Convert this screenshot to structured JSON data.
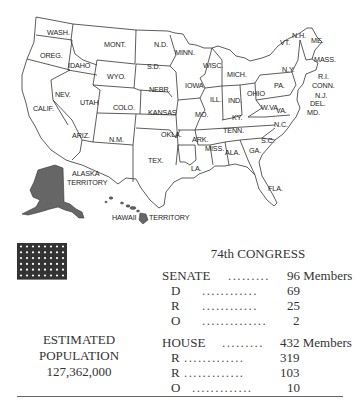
{
  "map": {
    "states": [
      {
        "label": "WASH.",
        "x": 47,
        "y": 35
      },
      {
        "label": "OREG.",
        "x": 40,
        "y": 58
      },
      {
        "label": "IDAHO",
        "x": 68,
        "y": 68
      },
      {
        "label": "MONT.",
        "x": 104,
        "y": 47
      },
      {
        "label": "N.D.",
        "x": 154,
        "y": 47
      },
      {
        "label": "MINN.",
        "x": 175,
        "y": 55
      },
      {
        "label": "S.D.",
        "x": 147,
        "y": 69
      },
      {
        "label": "WYO.",
        "x": 107,
        "y": 79
      },
      {
        "label": "NEBR.",
        "x": 149,
        "y": 92
      },
      {
        "label": "IOWA",
        "x": 185,
        "y": 88
      },
      {
        "label": "WISC.",
        "x": 203,
        "y": 68
      },
      {
        "label": "MICH.",
        "x": 227,
        "y": 77
      },
      {
        "label": "NEV.",
        "x": 55,
        "y": 97
      },
      {
        "label": "UTAH",
        "x": 80,
        "y": 105
      },
      {
        "label": "COLO.",
        "x": 113,
        "y": 110
      },
      {
        "label": "KANSAS",
        "x": 148,
        "y": 115
      },
      {
        "label": "CALIF.",
        "x": 33,
        "y": 111
      },
      {
        "label": "ILL.",
        "x": 210,
        "y": 102
      },
      {
        "label": "IND.",
        "x": 228,
        "y": 103
      },
      {
        "label": "OHIO",
        "x": 247,
        "y": 96
      },
      {
        "label": "PA.",
        "x": 274,
        "y": 88
      },
      {
        "label": "N.Y.",
        "x": 282,
        "y": 72
      },
      {
        "label": "MO.",
        "x": 195,
        "y": 117
      },
      {
        "label": "KY.",
        "x": 232,
        "y": 120
      },
      {
        "label": "W.VA.",
        "x": 261,
        "y": 110
      },
      {
        "label": "VA.",
        "x": 276,
        "y": 113
      },
      {
        "label": "ARIZ.",
        "x": 72,
        "y": 138
      },
      {
        "label": "N.M.",
        "x": 109,
        "y": 142
      },
      {
        "label": "OKLA.",
        "x": 161,
        "y": 137
      },
      {
        "label": "ARK.",
        "x": 192,
        "y": 142
      },
      {
        "label": "TENN.",
        "x": 223,
        "y": 133
      },
      {
        "label": "N.C.",
        "x": 274,
        "y": 127
      },
      {
        "label": "S.C.",
        "x": 261,
        "y": 143
      },
      {
        "label": "MISS.",
        "x": 205,
        "y": 151
      },
      {
        "label": "ALA.",
        "x": 225,
        "y": 155
      },
      {
        "label": "GA.",
        "x": 249,
        "y": 153
      },
      {
        "label": "TEX.",
        "x": 148,
        "y": 163
      },
      {
        "label": "LA.",
        "x": 191,
        "y": 171
      },
      {
        "label": "FLA.",
        "x": 268,
        "y": 191
      },
      {
        "label": "VT.",
        "x": 280,
        "y": 45
      },
      {
        "label": "N.H.",
        "x": 292,
        "y": 38
      },
      {
        "label": "ME.",
        "x": 311,
        "y": 43
      },
      {
        "label": "MASS.",
        "x": 314,
        "y": 62
      },
      {
        "label": "R.I.",
        "x": 318,
        "y": 79
      },
      {
        "label": "CONN.",
        "x": 312,
        "y": 88
      },
      {
        "label": "N.J.",
        "x": 315,
        "y": 98
      },
      {
        "label": "DEL.",
        "x": 310,
        "y": 106
      },
      {
        "label": "MD.",
        "x": 307,
        "y": 115
      }
    ],
    "territories": [
      {
        "label": "ALASKA",
        "x": 72,
        "y": 176
      },
      {
        "label": "TERRITORY",
        "x": 67,
        "y": 185
      },
      {
        "label": "HAWAII",
        "x": 112,
        "y": 220
      },
      {
        "label": "TERRITORY",
        "x": 149,
        "y": 220
      }
    ]
  },
  "flag": {
    "stars_rows": 6,
    "stars_cols": 8,
    "stripes": 13,
    "canton_color": "#333333",
    "stripe_color": "#555555"
  },
  "population": {
    "line1": "ESTIMATED",
    "line2": "POPULATION",
    "value": "127,362,000"
  },
  "congress": {
    "title": "74th CONGRESS",
    "senate": {
      "label": "SENATE",
      "dots": ".........",
      "total": "96 Members",
      "rows": [
        {
          "party": "D",
          "dots": "............",
          "value": "69"
        },
        {
          "party": "R",
          "dots": "............",
          "value": "25"
        },
        {
          "party": "O",
          "dots": "..............",
          "value": "2"
        }
      ]
    },
    "house": {
      "label": "HOUSE",
      "dots": ".........",
      "total": "432 Members",
      "rows": [
        {
          "party": "R",
          "dots": ".............",
          "value": "319"
        },
        {
          "party": "R",
          "dots": ".............",
          "value": "103"
        },
        {
          "party": "O",
          "dots": ".............",
          "value": "10"
        }
      ]
    }
  }
}
